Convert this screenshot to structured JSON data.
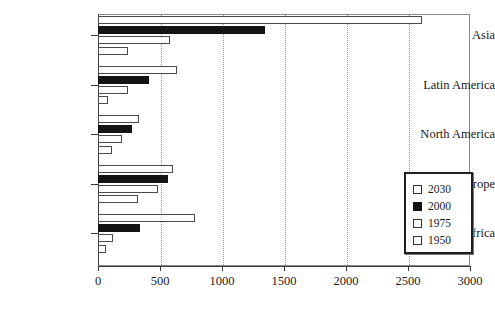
{
  "chart_data": {
    "type": "bar",
    "orientation": "horizontal",
    "title": "",
    "subtitle": "",
    "xlabel": "",
    "ylabel": "",
    "xlim": [
      0,
      3000
    ],
    "xticks": [
      "0",
      "500",
      "1000",
      "1500",
      "2000",
      "2500",
      "3000"
    ],
    "xtick_values": [
      0,
      500,
      1000,
      1500,
      2000,
      2500,
      3000
    ],
    "grid": "vertical-dotted",
    "legend_position": "lower-right",
    "categories": [
      "Asia",
      "Latin America",
      "North America",
      "Europe",
      "Africa"
    ],
    "series": [
      {
        "name": "2030",
        "fill": "#ffffff",
        "values": [
          2610,
          637,
          331,
          605,
          782
        ]
      },
      {
        "name": "2000",
        "fill": "#141414",
        "values": [
          1345,
          411,
          274,
          565,
          339
        ]
      },
      {
        "name": "1975",
        "fill": "#ffffff",
        "values": [
          580,
          242,
          194,
          484,
          121
        ]
      },
      {
        "name": "1950",
        "fill": "#ffffff",
        "values": [
          242,
          78,
          113,
          323,
          65
        ]
      }
    ]
  },
  "legend": {
    "items": [
      {
        "label": "2030",
        "filled": false
      },
      {
        "label": "2000",
        "filled": true
      },
      {
        "label": "1975",
        "filled": false
      },
      {
        "label": "1950",
        "filled": false
      }
    ]
  },
  "colors": {
    "bar_outline": "#4a4a4a",
    "bar_fill_dark": "#141414",
    "bar_fill_light": "#ffffff",
    "axis": "#3a3a3a",
    "grid": "#9a9a9a",
    "background": "#ffffff"
  }
}
